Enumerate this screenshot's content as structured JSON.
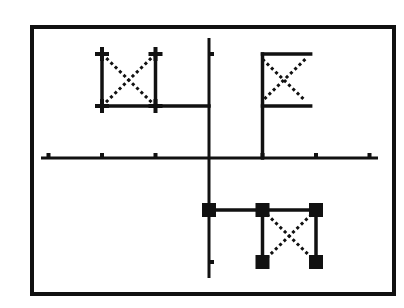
{
  "display": {
    "type": "graphing-calculator-screen",
    "frame": {
      "x": 32,
      "y": 27,
      "width": 362,
      "height": 267,
      "stroke": 4,
      "color": "#111111"
    },
    "background": "#ffffff",
    "ink": "#111111"
  },
  "axes": {
    "origin_px": {
      "x": 209,
      "y": 158
    },
    "unit_px": {
      "x": 53.5,
      "y": 52
    },
    "x_range": [
      -3,
      3
    ],
    "y_range": [
      -2,
      2
    ],
    "x_ticks": [
      -3,
      -2,
      -1,
      1,
      2,
      3
    ],
    "y_ticks": [
      2,
      -2
    ],
    "x_axis_extent_px": [
      41,
      378
    ],
    "y_axis_extent_px": [
      38,
      278
    ]
  },
  "chart_data": {
    "type": "scatter",
    "title": "",
    "xlabel": "",
    "ylabel": "",
    "xlim": [
      -3.1,
      3.1
    ],
    "ylim": [
      -2.3,
      2.3
    ],
    "grid": false,
    "series": [
      {
        "name": "flag-quadrant-2",
        "description": "Bowtie flag with plus-shaped corner markers; base line to y-axis",
        "marker": "plus",
        "points": [
          [
            -2,
            2
          ],
          [
            -1,
            2
          ],
          [
            -2,
            1
          ],
          [
            -1,
            1
          ]
        ],
        "segments": [
          [
            [
              -2,
              1
            ],
            [
              -2,
              2
            ]
          ],
          [
            [
              -1,
              1
            ],
            [
              -1,
              2
            ]
          ],
          [
            [
              -2,
              1
            ],
            [
              0,
              1
            ]
          ]
        ],
        "dotted_segments": [
          [
            [
              -2,
              2
            ],
            [
              -1,
              1
            ]
          ],
          [
            [
              -1,
              2
            ],
            [
              -2,
              1
            ]
          ]
        ]
      },
      {
        "name": "flag-quadrant-1",
        "description": "Flag on pole at x=1 from y=0 to y=2",
        "marker": "none",
        "points": [
          [
            1,
            0
          ],
          [
            1,
            2
          ],
          [
            1.9,
            2
          ],
          [
            1,
            1
          ],
          [
            1.9,
            1
          ]
        ],
        "segments": [
          [
            [
              1,
              0
            ],
            [
              1,
              2
            ]
          ],
          [
            [
              1,
              2
            ],
            [
              1.9,
              2
            ]
          ],
          [
            [
              1,
              1
            ],
            [
              1.9,
              1
            ]
          ]
        ],
        "dotted_segments": [
          [
            [
              1,
              1.9
            ],
            [
              1.8,
              1.1
            ]
          ],
          [
            [
              1.8,
              1.9
            ],
            [
              1,
              1.1
            ]
          ]
        ]
      },
      {
        "name": "flag-quadrant-4",
        "description": "Inverted bowtie flag with filled square markers",
        "marker": "square",
        "points": [
          [
            0,
            -1
          ],
          [
            1,
            -1
          ],
          [
            2,
            -1
          ],
          [
            1,
            -2
          ],
          [
            2,
            -2
          ]
        ],
        "segments": [
          [
            [
              0,
              -1
            ],
            [
              2,
              -1
            ]
          ],
          [
            [
              1,
              -1
            ],
            [
              1,
              -2
            ]
          ],
          [
            [
              2,
              -1
            ],
            [
              2,
              -2
            ]
          ]
        ],
        "dotted_segments": [
          [
            [
              1,
              -1
            ],
            [
              2,
              -2
            ]
          ],
          [
            [
              2,
              -1
            ],
            [
              1,
              -2
            ]
          ]
        ]
      }
    ]
  }
}
